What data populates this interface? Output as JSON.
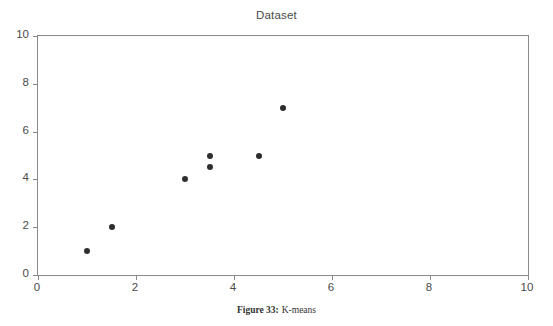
{
  "chart_data": {
    "type": "scatter",
    "title": "Dataset",
    "xlabel": "",
    "ylabel": "",
    "xlim": [
      0,
      10
    ],
    "ylim": [
      0,
      10
    ],
    "grid": false,
    "legend": null,
    "xticks": [
      "0",
      "2",
      "4",
      "6",
      "8",
      "10"
    ],
    "xtick_values": [
      0,
      2,
      4,
      6,
      8,
      10
    ],
    "yticks": [
      "0",
      "2",
      "4",
      "6",
      "8",
      "10"
    ],
    "ytick_values": [
      0,
      2,
      4,
      6,
      8,
      10
    ],
    "series": [
      {
        "name": "Dataset",
        "marker": "filled-circle",
        "color": "#2e2e2e",
        "points": [
          {
            "x": 1.0,
            "y": 1.0
          },
          {
            "x": 1.5,
            "y": 2.0
          },
          {
            "x": 3.0,
            "y": 4.0
          },
          {
            "x": 3.5,
            "y": 4.5
          },
          {
            "x": 3.5,
            "y": 5.0
          },
          {
            "x": 4.5,
            "y": 5.0
          },
          {
            "x": 5.0,
            "y": 7.0
          }
        ]
      }
    ]
  },
  "caption": {
    "label": "Figure 33:",
    "text": "K-means"
  },
  "colors": {
    "axis": "#8a8a8a",
    "marker": "#2e2e2e",
    "text": "#4a4a4a",
    "background": "#ffffff"
  }
}
